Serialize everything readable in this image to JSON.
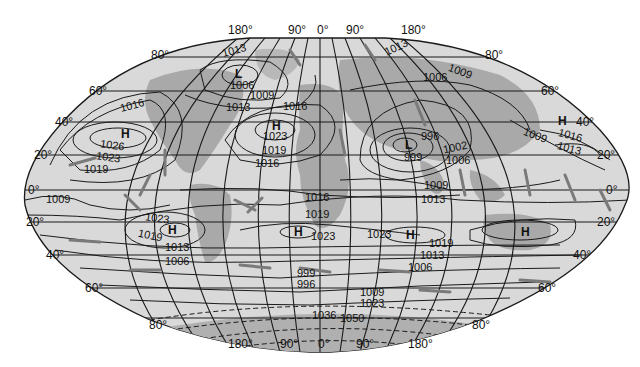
{
  "map": {
    "type": "world sea-level pressure map (elliptical projection)",
    "colors": {
      "ocean": "#d9d9d9",
      "land": "#a9a9a9",
      "land_dark": "#8e8e8e",
      "lines": "#1a1a1a",
      "arrows": "#7a7a7a",
      "background": "#ffffff"
    },
    "longitude_labels_top": [
      "180°",
      "90°",
      "0°",
      "90°",
      "180°"
    ],
    "longitude_labels_bottom": [
      "180°",
      "90°",
      "0°",
      "90°",
      "180°"
    ],
    "latitude_labels_left": [
      "80°",
      "60°",
      "40°",
      "20°",
      "0°",
      "20°",
      "40°",
      "60°",
      "80°"
    ],
    "latitude_labels_right": [
      "80°",
      "60°",
      "40°",
      "20°",
      "0°",
      "20°",
      "40°",
      "60°",
      "80°"
    ],
    "pressure_centers": [
      {
        "symbol": "L",
        "value": "1006",
        "label": "L-north-pacific"
      },
      {
        "symbol": "H",
        "value": "1026",
        "label": "H-north-atlantic-west"
      },
      {
        "symbol": "H",
        "value": "1023",
        "label": "H-north-atlantic"
      },
      {
        "symbol": "L",
        "value": "996",
        "label": "L-asia"
      },
      {
        "symbol": "H",
        "value": "",
        "label": "H-east-pacific"
      },
      {
        "symbol": "H",
        "value": "",
        "label": "H-south-pacific"
      },
      {
        "symbol": "H",
        "value": "1023",
        "label": "H-south-atlantic"
      },
      {
        "symbol": "H",
        "value": "",
        "label": "H-indian-ocean"
      },
      {
        "symbol": "H",
        "value": "",
        "label": "H-south-pacific-east"
      }
    ],
    "isobar_labels": [
      "1013",
      "1006",
      "1009",
      "1013",
      "1016",
      "1016",
      "1026",
      "1023",
      "1019",
      "1023",
      "1019",
      "1016",
      "1013",
      "1006",
      "1009",
      "996",
      "999",
      "1002",
      "1006",
      "1009",
      "1016",
      "1013",
      "1009",
      "1013",
      "1016",
      "1019",
      "1023",
      "1023",
      "1019",
      "1013",
      "1006",
      "1023",
      "1019",
      "1013",
      "1006",
      "1009",
      "999",
      "996",
      "1009",
      "1023",
      "1036",
      "1050"
    ]
  }
}
